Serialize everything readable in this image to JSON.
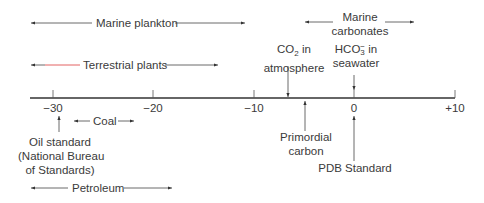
{
  "diagram": {
    "title": "",
    "axis": {
      "min": -30,
      "max": 10,
      "ticks": [
        {
          "value": -30,
          "label": "−30"
        },
        {
          "value": -20,
          "label": "−20"
        },
        {
          "value": -10,
          "label": "−10"
        },
        {
          "value": 0,
          "label": "0"
        },
        {
          "value": 10,
          "label": "+10"
        }
      ]
    },
    "ranges": [
      {
        "label": "Marine plankton",
        "from": -32,
        "to": -10
      },
      {
        "label": "Marine carbonates",
        "line1": "Marine",
        "line2": "carbonates",
        "from": -4,
        "to": 4
      },
      {
        "label": "Terrestrial plants",
        "from": -32,
        "to": -14
      },
      {
        "label": "Coal",
        "from": -27,
        "to": -21
      },
      {
        "label": "Petroleum",
        "from": -32,
        "to": -18
      }
    ],
    "markers": [
      {
        "label": "CO2 in atmosphere",
        "line1_main": "CO",
        "line1_sub": "2",
        "line1_rest": " in",
        "line2": "atmosphere",
        "value": -7,
        "direction": "down"
      },
      {
        "label": "HCO3- in seawater",
        "line1_main": "HCO",
        "line1_sub": "3",
        "line1_sup": "−",
        "line1_rest": " in",
        "line2": "seawater",
        "value": 0,
        "direction": "down"
      },
      {
        "label": "Oil standard (National Bureau of Standards)",
        "line1": "Oil standard",
        "line2": "(National Bureau",
        "line3": "of Standards)",
        "value": -30,
        "direction": "up"
      },
      {
        "label": "Primordial carbon",
        "line1": "Primordial",
        "line2": "carbon",
        "value": -5,
        "direction": "up"
      },
      {
        "label": "PDB Standard",
        "value": 0,
        "direction": "up"
      }
    ]
  },
  "colors": {
    "line": "#333333",
    "text": "#3a3a3a",
    "accent_red": "#e05050"
  }
}
